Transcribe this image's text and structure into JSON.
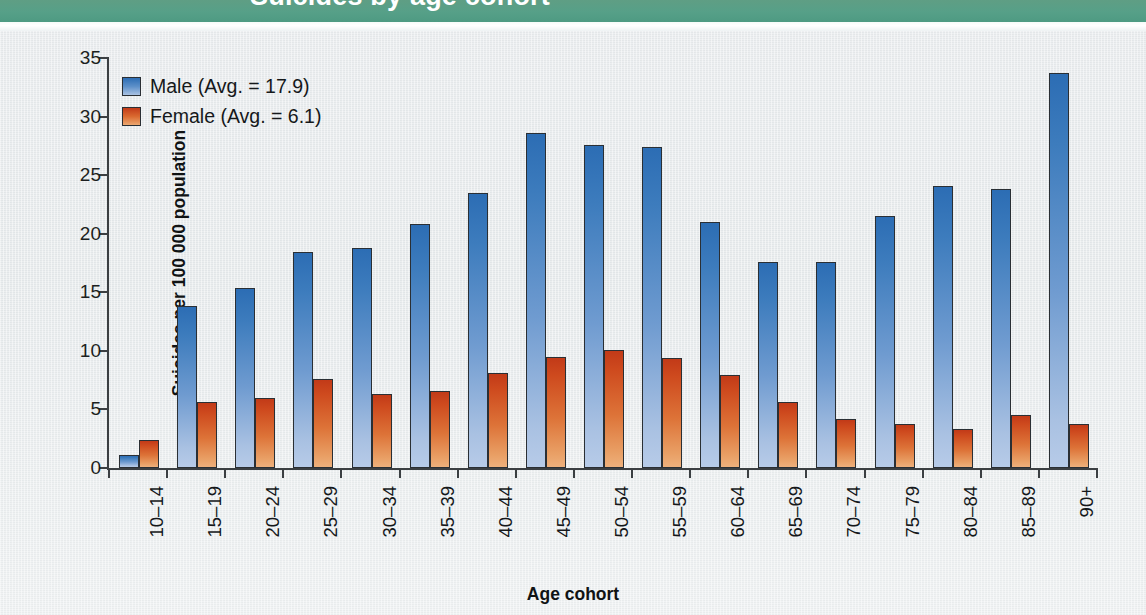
{
  "banner": {
    "text": "Suicides by age cohort"
  },
  "legend": {
    "position": "top-left-inside",
    "items": [
      {
        "key": "male",
        "label": "Male (Avg. = 17.9)",
        "color": "#2c6db4",
        "swatch": "male-swatch"
      },
      {
        "key": "female",
        "label": "Female (Avg. = 6.1)",
        "color": "#c23a18",
        "swatch": "female-swatch"
      }
    ]
  },
  "axes": {
    "y_title": "Suicides per 100 000 population",
    "x_title": "Age cohort",
    "y_ticks": [
      "0",
      "5",
      "10",
      "15",
      "20",
      "25",
      "30",
      "35"
    ]
  },
  "chart_data": {
    "type": "bar",
    "title": "Suicides by age cohort",
    "xlabel": "Age cohort",
    "ylabel": "Suicides per 100 000 population",
    "ylim": [
      0,
      35
    ],
    "ytick_step": 5,
    "grid": false,
    "legend_position": "upper left (inside plot)",
    "categories": [
      "10–14",
      "15–19",
      "20–24",
      "25–29",
      "30–34",
      "35–39",
      "40–44",
      "45–49",
      "50–54",
      "55–59",
      "60–64",
      "65–69",
      "70–74",
      "75–79",
      "80–84",
      "85–89",
      "90+"
    ],
    "series": [
      {
        "name": "Male",
        "legend_label": "Male (Avg. = 17.9)",
        "average": 17.9,
        "color": "#2c6db4",
        "values": [
          1.1,
          13.8,
          15.4,
          18.4,
          18.8,
          20.8,
          23.5,
          28.6,
          27.6,
          27.4,
          21.0,
          17.6,
          17.6,
          21.5,
          24.1,
          23.8,
          33.7
        ]
      },
      {
        "name": "Female",
        "legend_label": "Female (Avg. = 6.1)",
        "average": 6.1,
        "color": "#c23a18",
        "values": [
          2.4,
          5.6,
          6.0,
          7.6,
          6.3,
          6.6,
          8.1,
          9.5,
          10.1,
          9.4,
          7.9,
          5.6,
          4.2,
          3.8,
          3.3,
          4.5,
          3.8
        ]
      }
    ]
  },
  "colors": {
    "banner_green": "#55a087",
    "page_background": "#e7eaec",
    "axis": "#3b3f42",
    "male_bar": "#2c6db4",
    "female_bar": "#c23a18"
  }
}
